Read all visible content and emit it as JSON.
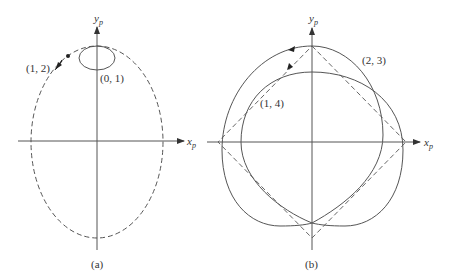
{
  "panels": [
    {
      "id": "a",
      "caption": "(a)",
      "x_axis_label": "x",
      "x_axis_subscript": "p",
      "y_axis_label": "y",
      "y_axis_subscript": "p",
      "curves": [
        {
          "label": "(1, 2)",
          "style": "dashed",
          "shape": "ellipse"
        },
        {
          "label": "(0, 1)",
          "style": "solid",
          "shape": "small-ellipse"
        }
      ]
    },
    {
      "id": "b",
      "caption": "(b)",
      "x_axis_label": "x",
      "x_axis_subscript": "p",
      "y_axis_label": "y",
      "y_axis_subscript": "p",
      "curves": [
        {
          "label": "(2, 3)",
          "style": "solid",
          "shape": "closed-curve"
        },
        {
          "label": "(1, 4)",
          "style": "solid",
          "shape": "closed-curve"
        },
        {
          "label": "",
          "style": "dashed",
          "shape": "diamond"
        }
      ]
    }
  ],
  "colors": {
    "stroke": "#555555",
    "text": "#333333",
    "background": "#ffffff"
  }
}
